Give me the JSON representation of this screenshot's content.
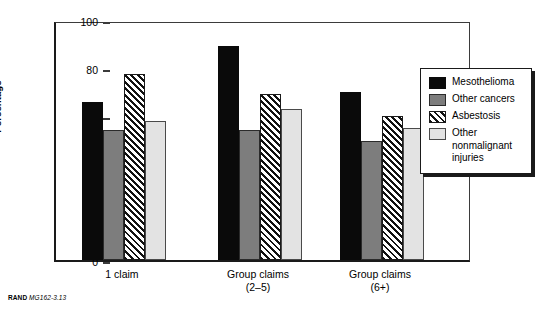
{
  "chart_data": {
    "type": "bar",
    "title": "",
    "subtitle": "",
    "xlabel": "",
    "ylabel": "Percentage",
    "ylim": [
      0,
      100
    ],
    "yticks": [
      0,
      20,
      40,
      60,
      80,
      100
    ],
    "grid": false,
    "legend_position": "right",
    "categories": [
      "1 claim",
      "Group claims\n(2–5)",
      "Group claims\n(6+)"
    ],
    "series": [
      {
        "name": "Mesothelioma",
        "values": [
          66,
          89,
          70
        ],
        "color": "#0a0a0a",
        "pattern": "solid"
      },
      {
        "name": "Other cancers",
        "values": [
          54,
          54,
          49.5
        ],
        "color": "#7d7d7d",
        "pattern": "solid"
      },
      {
        "name": "Asbestosis",
        "values": [
          77.5,
          69,
          60
        ],
        "color": "#ffffff",
        "pattern": "diagonal-hatch"
      },
      {
        "name": "Other nonmalignant injuries",
        "values": [
          58,
          63,
          55
        ],
        "color": "#e3e3e3",
        "pattern": "solid"
      }
    ]
  },
  "axis": {
    "y_title": "Percentage",
    "tick_labels": [
      "100",
      "80",
      "60",
      "40",
      "20",
      "0"
    ]
  },
  "x_axis": {
    "labels": [
      "1 claim",
      "Group claims\n(2–5)",
      "Group claims\n(6+)"
    ]
  },
  "legend": {
    "entries": [
      {
        "label": "Mesothelioma",
        "swatch": "mesothelioma"
      },
      {
        "label": "Other cancers",
        "swatch": "other-cancers"
      },
      {
        "label": "Asbestosis",
        "swatch": "asbestosis"
      },
      {
        "label": "Other\nnonmalignant\ninjuries",
        "swatch": "other-nonmalignant"
      }
    ]
  },
  "caption": {
    "org": "RAND",
    "figure_id": "MG162-3.13"
  }
}
